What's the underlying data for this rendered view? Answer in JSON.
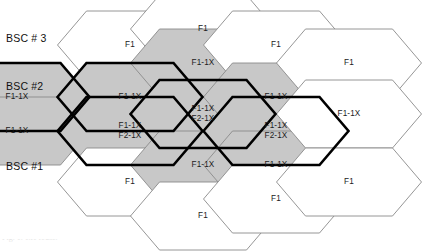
{
  "figure": {
    "caption_fragment": "Fig. 1. 1x1 reuse.",
    "colors": {
      "cell_fill_gray": "#c8c8c8",
      "cell_fill_white": "#ffffff",
      "border_thin": "#8a8a8a",
      "border_thick": "#000000",
      "text": "#1b1b1b",
      "background": "#ffffff"
    },
    "geometry": {
      "hex_width": 145,
      "hex_height": 68,
      "column_pitch": 72.5,
      "row_pitch": 34,
      "point_inset": 29
    }
  },
  "bsc_labels": [
    {
      "id": "bsc-3",
      "text": "BSC # 3",
      "x": 6,
      "y": 38
    },
    {
      "id": "bsc-2",
      "text": "BSC #2",
      "x": 6,
      "y": 86
    },
    {
      "id": "bsc-1",
      "text": "BSC #1",
      "x": 6,
      "y": 165
    }
  ],
  "legend_terms": {
    "f1": "F1",
    "f1_1x": "F1-1X",
    "f2_1x": "F2-1X"
  },
  "cells": [
    {
      "id": "c1r1",
      "col": 1,
      "cx": 17,
      "cy": 97,
      "fill": "gray",
      "border": "thick",
      "lines": [
        "F1-1X"
      ]
    },
    {
      "id": "c1r2",
      "col": 1,
      "cx": 17,
      "cy": 131,
      "fill": "gray",
      "border": "thin",
      "lines": [
        "F1-1X"
      ]
    },
    {
      "id": "c2r1",
      "col": 2,
      "cx": 130,
      "cy": 45,
      "fill": "white",
      "border": "thin",
      "lines": [
        "F1"
      ]
    },
    {
      "id": "c2r2",
      "col": 2,
      "cx": 130,
      "cy": 97,
      "fill": "gray",
      "border": "thick",
      "lines": [
        "F1-1X"
      ]
    },
    {
      "id": "c2r3",
      "col": 2,
      "cx": 130,
      "cy": 131,
      "fill": "gray",
      "border": "thick",
      "lines": [
        "F1-1X",
        "F2-1X"
      ]
    },
    {
      "id": "c2r4",
      "col": 2,
      "cx": 130,
      "cy": 182,
      "fill": "white",
      "border": "thin",
      "lines": [
        "F1"
      ]
    },
    {
      "id": "c3r1",
      "col": 3,
      "cx": 203,
      "cy": 29,
      "fill": "white",
      "border": "thin",
      "lines": [
        "F1"
      ]
    },
    {
      "id": "c3r2",
      "col": 3,
      "cx": 203,
      "cy": 63,
      "fill": "gray",
      "border": "thin",
      "lines": [
        "F1-1X"
      ]
    },
    {
      "id": "c3r3",
      "col": 3,
      "cx": 203,
      "cy": 114,
      "fill": "gray",
      "border": "thick",
      "lines": [
        "F1-1X",
        "F2-1X"
      ]
    },
    {
      "id": "c3r4",
      "col": 3,
      "cx": 203,
      "cy": 165,
      "fill": "gray",
      "border": "thin",
      "lines": [
        "F1-1X"
      ]
    },
    {
      "id": "c3r5",
      "col": 3,
      "cx": 203,
      "cy": 216,
      "fill": "white",
      "border": "thin",
      "lines": [
        "F1"
      ]
    },
    {
      "id": "c4r1",
      "col": 4,
      "cx": 276,
      "cy": 45,
      "fill": "white",
      "border": "thin",
      "lines": [
        "F1"
      ]
    },
    {
      "id": "c4r2",
      "col": 4,
      "cx": 276,
      "cy": 97,
      "fill": "gray",
      "border": "thin",
      "lines": [
        "F1-1X"
      ]
    },
    {
      "id": "c4r3",
      "col": 4,
      "cx": 276,
      "cy": 131,
      "fill": "gray",
      "border": "thick",
      "lines": [
        "F1-1X",
        "F2-1X"
      ]
    },
    {
      "id": "c4r4",
      "col": 4,
      "cx": 276,
      "cy": 165,
      "fill": "gray",
      "border": "thin",
      "lines": [
        "F1-1X"
      ]
    },
    {
      "id": "c4r5",
      "col": 4,
      "cx": 276,
      "cy": 199,
      "fill": "white",
      "border": "thin",
      "lines": [
        "F1"
      ]
    },
    {
      "id": "c5r1",
      "col": 5,
      "cx": 349,
      "cy": 63,
      "fill": "white",
      "border": "thin",
      "lines": [
        "F1"
      ]
    },
    {
      "id": "c5r2",
      "col": 5,
      "cx": 349,
      "cy": 114,
      "fill": "white",
      "border": "thin",
      "lines": [
        "F1-1X"
      ]
    },
    {
      "id": "c5r3",
      "col": 5,
      "cx": 349,
      "cy": 182,
      "fill": "white",
      "border": "thin",
      "lines": [
        "F1"
      ]
    }
  ]
}
